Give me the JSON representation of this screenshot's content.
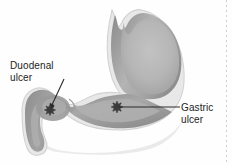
{
  "figure": {
    "type": "anatomical-diagram",
    "background_color": "#fefefe"
  },
  "labels": {
    "duodenal": {
      "line1": "Duodenal",
      "line2": "ulcer",
      "marker": "star-asterisk",
      "marker_color": "#3a3a3a",
      "marker_x": 50,
      "marker_y": 110,
      "leader": "diagonal-arrow"
    },
    "gastric": {
      "line1": "Gastric",
      "line2": "ulcer",
      "marker": "star-asterisk",
      "marker_color": "#3a3a3a",
      "marker_x": 117,
      "marker_y": 107,
      "leader": "horizontal-line"
    }
  },
  "anatomy": {
    "stomach_fill_light": "#b9b9b9",
    "stomach_fill_dark": "#8c8c8c",
    "wall_outline": "#d6d6d6",
    "shadow": "#cfcfcf"
  },
  "border": {
    "right_dotted_color": "#cccccc"
  }
}
